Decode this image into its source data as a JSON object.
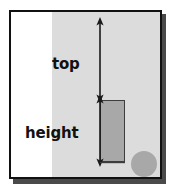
{
  "figure": {
    "frame": {
      "border_color": "#111111",
      "shadow_color": "#4a4a4a",
      "background": "#ffffff"
    },
    "panel": {
      "name": "gray-background-panel",
      "color": "#dcdcdc"
    },
    "rectangle": {
      "name": "measured-rectangle",
      "fill": "#a8a8a8",
      "stroke": "#3d3d3d"
    },
    "circle": {
      "name": "circle-marker",
      "fill": "#a8a8a8"
    },
    "dimensions": [
      {
        "key": "top",
        "label": "top",
        "arrow": "double-ended-vertical",
        "from": "canvas-top",
        "to": "rectangle-top"
      },
      {
        "key": "height",
        "label": "height",
        "arrow": "double-ended-vertical",
        "from": "rectangle-top",
        "to": "rectangle-bottom"
      }
    ],
    "labels": {
      "top": "top",
      "height": "height"
    },
    "line_color": "#1a1a1a"
  }
}
